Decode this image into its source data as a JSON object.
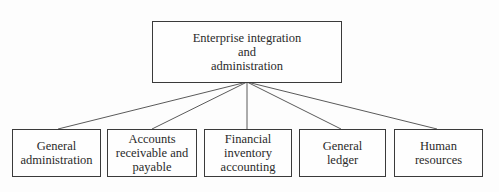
{
  "diagram": {
    "type": "org-chart",
    "root": {
      "id": "root",
      "label": "Enterprise integration\nand\nadministration"
    },
    "children": [
      {
        "id": "c1",
        "label": "General\nadministration"
      },
      {
        "id": "c2",
        "label": "Accounts\nreceivable and\npayable"
      },
      {
        "id": "c3",
        "label": "Financial\ninventory\naccounting"
      },
      {
        "id": "c4",
        "label": "General\nledger"
      },
      {
        "id": "c5",
        "label": "Human\nresources"
      }
    ],
    "edges": [
      {
        "from": "root",
        "to": "c1"
      },
      {
        "from": "root",
        "to": "c2"
      },
      {
        "from": "root",
        "to": "c3"
      },
      {
        "from": "root",
        "to": "c4"
      },
      {
        "from": "root",
        "to": "c5"
      }
    ],
    "colors": {
      "line": "#5a5a5a",
      "border": "#3a3a3a",
      "text": "#2a2a2a",
      "background": "#fdfdfd"
    }
  }
}
